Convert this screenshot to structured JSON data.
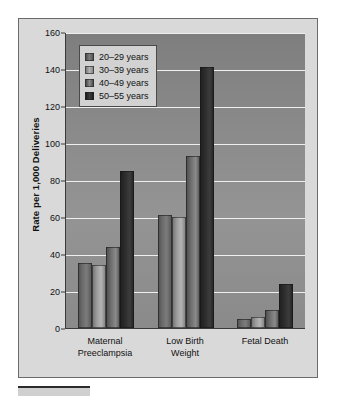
{
  "chart_data": {
    "type": "bar",
    "title": "",
    "xlabel": "",
    "ylabel": "Rate per 1,000 Deliveries",
    "ylim": [
      0,
      160
    ],
    "yticks": [
      0,
      20,
      40,
      60,
      80,
      100,
      120,
      140,
      160
    ],
    "grid": true,
    "legend_position": "top-left-inside",
    "categories": [
      [
        "Maternal",
        "Preeclampsia"
      ],
      [
        "Low Birth",
        "Weight"
      ],
      [
        "Fetal Death"
      ]
    ],
    "category_labels": [
      "Maternal Preeclampsia",
      "Low Birth Weight",
      "Fetal Death"
    ],
    "series": [
      {
        "name": "20–29 years",
        "color": "#6a6a6a",
        "values": [
          35,
          61,
          5
        ]
      },
      {
        "name": "30–39 years",
        "color": "#b4b4b4",
        "values": [
          34,
          60,
          6
        ]
      },
      {
        "name": "40–49 years",
        "color": "#6d6d6d",
        "values": [
          44,
          93,
          10
        ]
      },
      {
        "name": "50–55 years",
        "color": "#232323",
        "values": [
          85,
          141,
          24
        ]
      }
    ]
  },
  "legend": {
    "items": [
      {
        "label": "20–29 years"
      },
      {
        "label": "30–39 years"
      },
      {
        "label": "40–49 years"
      },
      {
        "label": "50–55 years"
      }
    ]
  },
  "colors": {
    "panel_background": "#d9d9d9",
    "panel_border": "#6b6b6b",
    "plot_background": "#8a8a8a",
    "gridline": "#efefef",
    "axis": "#3a3a3a",
    "text": "#111111",
    "legend_background": "#d2d2d2"
  }
}
